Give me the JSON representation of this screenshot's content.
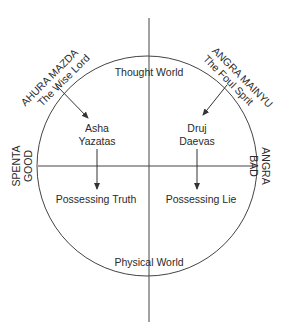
{
  "diagram": {
    "quadrant_labels": {
      "top": "Thought World",
      "bottom": "Physical World"
    },
    "side_labels": {
      "left": [
        "SPENTA",
        "GOOD"
      ],
      "right": [
        "ANGRA",
        "BAD"
      ]
    },
    "good_spirit": {
      "name": "AHURA MAZDA",
      "title": "The Wise Lord",
      "entities": [
        "Asha",
        "Yazatas"
      ],
      "result": "Possessing Truth"
    },
    "evil_spirit": {
      "name": "ANGRA MAINYU",
      "title": "The Foul Sprit",
      "entities": [
        "Druj",
        "Daevas"
      ],
      "result": "Possessing Lie"
    },
    "colors": {
      "stroke": "#333333",
      "text": "#2a2a2a",
      "background": "#ffffff"
    }
  }
}
